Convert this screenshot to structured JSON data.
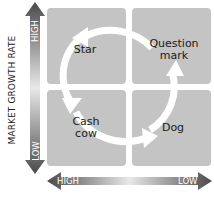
{
  "diagram": {
    "type": "BCG growth-share matrix",
    "y_axis": {
      "label": "MARKET GROWTH RATE",
      "high": "HIGH",
      "low": "LOW"
    },
    "x_axis": {
      "high": "HIGH",
      "low": "LOW"
    },
    "quadrants": [
      {
        "id": "star",
        "label": "Star",
        "position": "top-left"
      },
      {
        "id": "question-mark",
        "label_line1": "Question",
        "label_line2": "mark",
        "position": "top-right"
      },
      {
        "id": "cash-cow",
        "label_line1": "Cash",
        "label_line2": "cow",
        "position": "bottom-left"
      },
      {
        "id": "dog",
        "label": "Dog",
        "position": "bottom-right"
      }
    ],
    "cycle": [
      "Question mark",
      "Star",
      "Cash cow",
      "Dog",
      "Question mark"
    ],
    "colors": {
      "quadrant": "#c4c4c4",
      "arrow": "#ffffff",
      "axis_dark": "#4a4a4a",
      "axis_light": "#e6e6e6"
    }
  }
}
